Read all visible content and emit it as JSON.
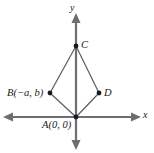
{
  "figure": {
    "background_color": "#ffffff",
    "axis_color": "#6e6e6e",
    "shape_color": "#5a5a66",
    "point_color": "#1a1a1a",
    "text_color": "#1a1a1a"
  },
  "axes": {
    "x_label": "x",
    "y_label": "y",
    "x_line": {
      "x1": 8,
      "y1": 117,
      "x2": 137,
      "y2": 117
    },
    "y_line": {
      "x1": 76,
      "y1": 18,
      "x2": 76,
      "y2": 145
    },
    "arrowheads": [
      "left",
      "right",
      "up",
      "down"
    ]
  },
  "points": [
    {
      "id": "A",
      "label": "A(0, 0)",
      "x": 76,
      "y": 117,
      "label_x": 42,
      "label_y": 120
    },
    {
      "id": "B",
      "label": "B(−a, b)",
      "x": 50,
      "y": 93,
      "label_x": 7,
      "label_y": 88
    },
    {
      "id": "C",
      "label": "C",
      "x": 76,
      "y": 46,
      "label_x": 81,
      "label_y": 40
    },
    {
      "id": "D",
      "label": "D",
      "x": 99,
      "y": 93,
      "label_x": 104,
      "label_y": 88
    }
  ],
  "edges": [
    {
      "from": "A",
      "to": "B"
    },
    {
      "from": "B",
      "to": "C"
    },
    {
      "from": "C",
      "to": "D"
    },
    {
      "from": "D",
      "to": "A"
    }
  ],
  "diagonal": {
    "from": "C",
    "to": "A"
  }
}
